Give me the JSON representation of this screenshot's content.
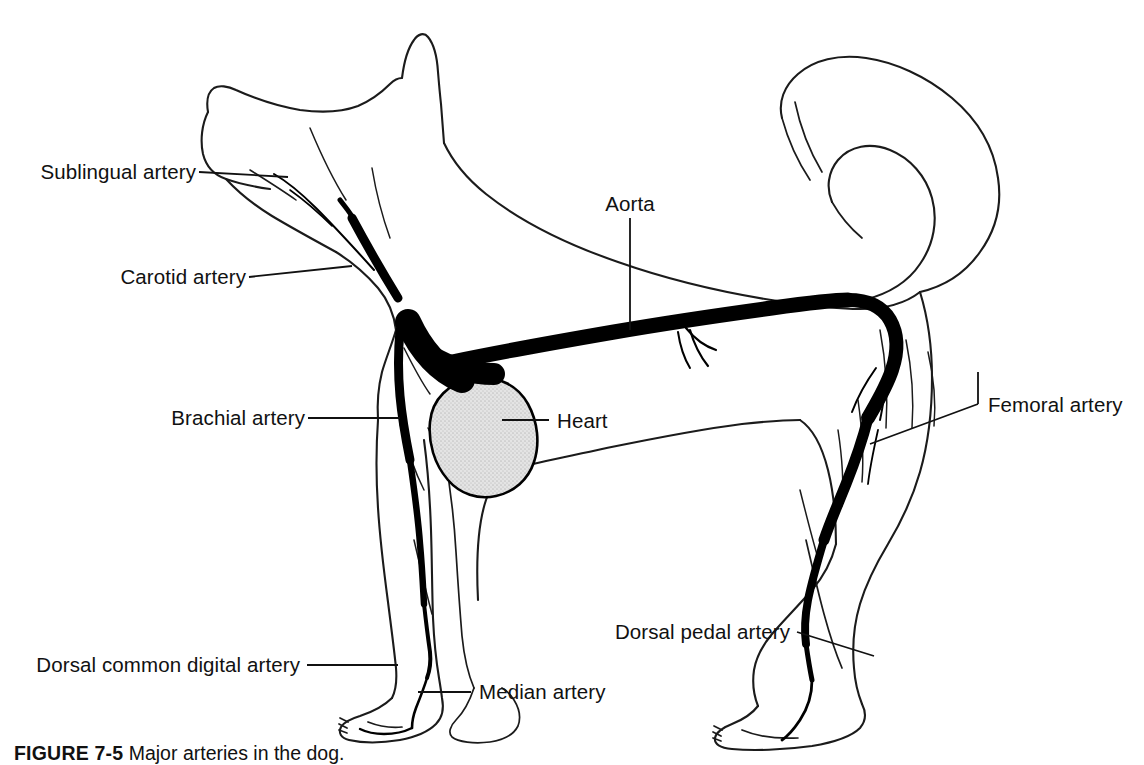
{
  "figure": {
    "number": "FIGURE 7-5",
    "caption_text": "Major arteries in the dog.",
    "background_color": "#ffffff",
    "line_color": "#1b1b1b",
    "artery_color": "#000000",
    "heart_fill_color": "#d8d8d8"
  },
  "labels": {
    "sublingual": "Sublingual artery",
    "carotid": "Carotid artery",
    "brachial": "Brachial artery",
    "aorta": "Aorta",
    "heart": "Heart",
    "femoral": "Femoral artery",
    "dorsal_pedal": "Dorsal pedal artery",
    "dorsal_common_digital": "Dorsal common digital artery",
    "median": "Median artery"
  },
  "structures": [
    {
      "id": "sublingual",
      "name": "Sublingual artery",
      "region": "head"
    },
    {
      "id": "carotid",
      "name": "Carotid artery",
      "region": "neck"
    },
    {
      "id": "brachial",
      "name": "Brachial artery",
      "region": "foreleg"
    },
    {
      "id": "aorta",
      "name": "Aorta",
      "region": "trunk"
    },
    {
      "id": "heart",
      "name": "Heart",
      "region": "thorax"
    },
    {
      "id": "femoral",
      "name": "Femoral artery",
      "region": "hindleg"
    },
    {
      "id": "dorsal_pedal",
      "name": "Dorsal pedal artery",
      "region": "hindpaw"
    },
    {
      "id": "dorsal_common_digital",
      "name": "Dorsal common digital artery",
      "region": "forepaw"
    },
    {
      "id": "median",
      "name": "Median artery",
      "region": "forepaw"
    }
  ]
}
